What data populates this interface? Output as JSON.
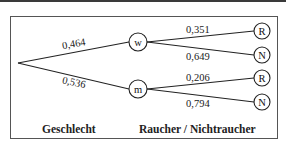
{
  "diagram": {
    "type": "probability-tree",
    "root": {
      "x": 18,
      "y": 63
    },
    "level1": {
      "caption": "Geschlecht",
      "nodes": [
        {
          "label": "w",
          "prob": "0,464"
        },
        {
          "label": "m",
          "prob": "0,536"
        }
      ]
    },
    "level2": {
      "caption": "Raucher / Nichtraucher",
      "branches": [
        {
          "parent": "w",
          "label": "R",
          "prob": "0,351"
        },
        {
          "parent": "w",
          "label": "N",
          "prob": "0,649"
        },
        {
          "parent": "m",
          "label": "R",
          "prob": "0,206"
        },
        {
          "parent": "m",
          "label": "N",
          "prob": "0,794"
        }
      ]
    }
  }
}
